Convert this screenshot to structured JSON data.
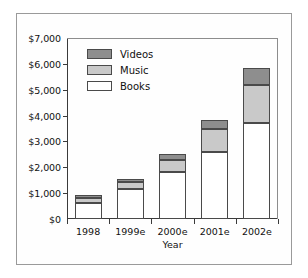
{
  "chart_data": {
    "type": "bar",
    "stacked": true,
    "title": "",
    "xlabel": "Year",
    "ylabel": "",
    "categories": [
      "1998",
      "1999e",
      "2000e",
      "2001e",
      "2002e"
    ],
    "series": [
      {
        "name": "Books",
        "color": "#ffffff",
        "values": [
          620,
          1180,
          1800,
          2580,
          3700
        ]
      },
      {
        "name": "Music",
        "color": "#c9c9c9",
        "values": [
          180,
          240,
          480,
          900,
          1500
        ]
      },
      {
        "name": "Videos",
        "color": "#8e8e8e",
        "values": [
          120,
          140,
          240,
          340,
          650
        ]
      }
    ],
    "totals": [
      920,
      1560,
      2520,
      3820,
      5850
    ],
    "ylim": [
      0,
      7000
    ],
    "ytick_values": [
      0,
      1000,
      2000,
      3000,
      4000,
      5000,
      6000,
      7000
    ],
    "ytick_labels": [
      "$0",
      "$1,000",
      "$2,000",
      "$3,000",
      "$4,000",
      "$5,000",
      "$6,000",
      "$7,000"
    ],
    "grid": false,
    "legend_position": "upper-left-inside",
    "legend_order": [
      "Videos",
      "Music",
      "Books"
    ]
  },
  "axes": {
    "x_title": "Year"
  },
  "legend": {
    "items": [
      {
        "label": "Videos",
        "swatch": "videos"
      },
      {
        "label": "Music",
        "swatch": "music"
      },
      {
        "label": "Books",
        "swatch": "books"
      }
    ]
  }
}
